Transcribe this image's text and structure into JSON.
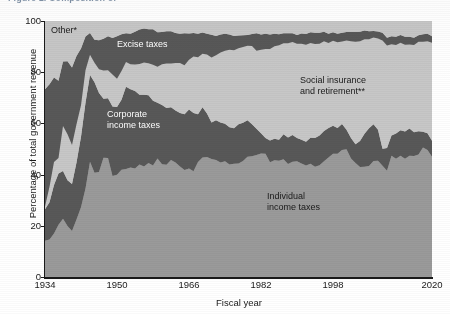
{
  "figure": {
    "title_visible_fragment": "Figure 1. Composition of"
  },
  "axes": {
    "ylabel": "Percentage of total government revenue",
    "xlabel": "Fiscal year",
    "yticks": [
      "0",
      "20",
      "40",
      "60",
      "80",
      "100"
    ],
    "xticks": [
      "1934",
      "1950",
      "1966",
      "1982",
      "1998",
      "2020"
    ]
  },
  "labels": {
    "other": "Other*",
    "excise": "Excise taxes",
    "corporate": "Corporate\nincome taxes",
    "corporate_line1": "Corporate",
    "corporate_line2": "income taxes",
    "social_line1": "Social insurance",
    "social_line2": "and retirement**",
    "individual_line1": "Individual",
    "individual_line2": "income taxes"
  },
  "colors": {
    "individual": "#9a9a9a",
    "corporate": "#585858",
    "social": "#c7c7c7",
    "excise": "#585858",
    "other": "#c7c7c7",
    "plot_background": "#c7c7c7",
    "axis": "#1a1a1a",
    "label_light": "#ffffff",
    "label_dark": "#1a1a1a",
    "title": "#15365c"
  },
  "chart_data": {
    "type": "area",
    "stacked": true,
    "xlabel": "Fiscal year",
    "ylabel": "Percentage of total government revenue",
    "ylim": [
      0,
      100
    ],
    "xlim": [
      1934,
      2020
    ],
    "grid": false,
    "legend": "in-plot annotations",
    "tick_years": [
      1934,
      1950,
      1966,
      1982,
      1998,
      2020
    ],
    "ytick_values": [
      0,
      20,
      40,
      60,
      80,
      100
    ],
    "x": [
      1934,
      1935,
      1936,
      1937,
      1938,
      1939,
      1940,
      1941,
      1942,
      1943,
      1944,
      1945,
      1946,
      1947,
      1948,
      1949,
      1950,
      1951,
      1952,
      1953,
      1954,
      1955,
      1956,
      1957,
      1958,
      1959,
      1960,
      1961,
      1962,
      1963,
      1964,
      1965,
      1966,
      1967,
      1968,
      1969,
      1970,
      1971,
      1972,
      1973,
      1974,
      1975,
      1976,
      1977,
      1978,
      1979,
      1980,
      1981,
      1982,
      1983,
      1984,
      1985,
      1986,
      1987,
      1988,
      1989,
      1990,
      1991,
      1992,
      1993,
      1994,
      1995,
      1996,
      1997,
      1998,
      1999,
      2000,
      2001,
      2002,
      2003,
      2004,
      2005,
      2006,
      2007,
      2008,
      2009,
      2010,
      2011,
      2012,
      2013,
      2014,
      2015,
      2016,
      2017,
      2018,
      2019,
      2020
    ],
    "series": [
      {
        "name": "Individual income taxes",
        "color": "#9a9a9a",
        "values": [
          14.2,
          14.6,
          17.0,
          20.4,
          22.8,
          19.9,
          18.0,
          22.5,
          27.2,
          34.6,
          45.0,
          40.7,
          41.0,
          46.6,
          46.5,
          39.5,
          39.9,
          41.9,
          42.2,
          42.8,
          42.4,
          43.9,
          43.2,
          44.5,
          43.6,
          46.3,
          44.0,
          43.8,
          45.7,
          44.7,
          43.2,
          41.8,
          42.4,
          41.3,
          44.9,
          46.7,
          46.9,
          46.1,
          45.7,
          44.7,
          45.2,
          43.9,
          44.2,
          44.3,
          45.3,
          47.0,
          47.2,
          47.7,
          48.2,
          48.1,
          44.8,
          45.6,
          45.4,
          46.0,
          44.1,
          45.0,
          45.2,
          44.3,
          43.6,
          44.2,
          43.1,
          43.7,
          45.2,
          46.7,
          48.1,
          48.1,
          49.6,
          49.9,
          46.3,
          44.5,
          43.0,
          43.1,
          43.4,
          45.3,
          45.4,
          43.5,
          41.5,
          47.4,
          46.2,
          47.4,
          46.2,
          47.4,
          47.3,
          47.9,
          50.6,
          49.6,
          47.0
        ]
      },
      {
        "name": "Corporate income taxes",
        "color": "#585858",
        "values": [
          12.3,
          14.6,
          18.9,
          20.0,
          18.6,
          17.9,
          18.3,
          22.2,
          27.6,
          33.5,
          33.9,
          35.4,
          30.9,
          23.0,
          23.3,
          27.1,
          26.5,
          27.3,
          32.1,
          30.5,
          30.3,
          27.3,
          28.0,
          26.5,
          25.2,
          21.8,
          23.2,
          22.2,
          20.6,
          20.3,
          20.9,
          21.8,
          23.0,
          22.8,
          18.7,
          19.6,
          17.0,
          14.3,
          15.5,
          15.7,
          14.7,
          14.6,
          13.9,
          15.4,
          15.0,
          14.2,
          12.5,
          10.2,
          8.0,
          6.2,
          8.5,
          8.4,
          8.2,
          9.8,
          10.4,
          10.5,
          9.1,
          9.3,
          9.2,
          10.2,
          11.2,
          11.6,
          11.8,
          11.5,
          11.0,
          10.1,
          10.2,
          7.6,
          8.0,
          7.4,
          10.1,
          12.9,
          14.7,
          14.4,
          12.1,
          6.6,
          8.9,
          7.9,
          9.9,
          9.9,
          10.6,
          10.6,
          9.2,
          9.0,
          6.1,
          6.6,
          6.2
        ]
      },
      {
        "name": "Social insurance and retirement**",
        "color": "#c7c7c7",
        "values": [
          1.0,
          6.1,
          9.0,
          6.1,
          17.6,
          18.0,
          15.3,
          15.0,
          12.3,
          12.7,
          7.9,
          7.6,
          9.3,
          11.1,
          11.0,
          12.5,
          11.0,
          11.3,
          9.7,
          9.8,
          10.3,
          12.0,
          12.6,
          12.5,
          14.1,
          14.0,
          15.9,
          17.4,
          17.1,
          18.6,
          19.5,
          19.1,
          19.5,
          22.0,
          22.2,
          20.9,
          23.0,
          25.3,
          25.4,
          27.3,
          28.5,
          30.3,
          30.5,
          29.7,
          29.5,
          29.1,
          30.5,
          30.5,
          32.6,
          34.8,
          35.8,
          36.1,
          36.9,
          35.5,
          36.8,
          36.3,
          36.8,
          37.5,
          37.9,
          37.0,
          36.7,
          35.8,
          35.1,
          33.2,
          33.2,
          33.5,
          32.2,
          34.9,
          37.8,
          40.0,
          39.0,
          36.9,
          34.8,
          33.9,
          35.7,
          42.3,
          40.0,
          35.6,
          34.5,
          34.2,
          33.9,
          32.8,
          34.1,
          35.0,
          35.2,
          35.9,
          38.3
        ]
      },
      {
        "name": "Excise taxes",
        "color": "#585858",
        "values": [
          45.8,
          40.0,
          33.0,
          30.2,
          25.2,
          28.5,
          30.2,
          26.6,
          22.2,
          13.1,
          8.5,
          9.0,
          11.3,
          12.4,
          13.2,
          14.3,
          16.6,
          14.3,
          11.2,
          11.9,
          12.8,
          13.5,
          13.3,
          13.3,
          13.9,
          13.5,
          12.6,
          12.6,
          12.6,
          11.7,
          11.4,
          12.5,
          10.2,
          9.2,
          9.2,
          8.3,
          8.1,
          8.9,
          7.5,
          7.0,
          6.6,
          5.9,
          5.5,
          4.9,
          4.6,
          4.2,
          4.7,
          6.8,
          5.9,
          5.9,
          5.6,
          4.9,
          4.3,
          3.9,
          3.9,
          3.4,
          3.4,
          4.0,
          4.2,
          4.2,
          4.4,
          4.3,
          3.7,
          3.6,
          3.3,
          3.3,
          3.4,
          3.3,
          3.6,
          3.8,
          3.7,
          3.4,
          3.1,
          2.5,
          2.7,
          3.0,
          3.1,
          3.1,
          3.2,
          3.0,
          3.1,
          3.0,
          2.9,
          2.5,
          2.9,
          2.9,
          2.5
        ]
      },
      {
        "name": "Other*",
        "color": "#c7c7c7",
        "values": [
          26.7,
          24.7,
          22.1,
          23.3,
          15.8,
          15.7,
          18.2,
          13.7,
          10.7,
          6.1,
          4.7,
          7.3,
          7.5,
          6.9,
          6.0,
          6.6,
          6.0,
          5.2,
          4.8,
          5.0,
          4.2,
          3.3,
          2.9,
          3.2,
          3.2,
          4.4,
          4.3,
          4.0,
          4.0,
          4.7,
          5.0,
          4.8,
          4.9,
          4.7,
          5.0,
          4.5,
          5.0,
          5.4,
          5.9,
          5.3,
          5.0,
          5.3,
          5.9,
          5.7,
          5.6,
          5.5,
          5.1,
          4.8,
          5.3,
          5.0,
          5.3,
          5.0,
          5.2,
          4.8,
          4.8,
          4.8,
          5.5,
          4.9,
          5.1,
          4.4,
          4.6,
          4.6,
          4.2,
          5.0,
          4.4,
          5.0,
          4.6,
          4.3,
          4.3,
          4.3,
          4.2,
          3.7,
          4.0,
          3.9,
          4.1,
          4.6,
          6.5,
          6.0,
          6.2,
          5.5,
          6.2,
          6.2,
          6.5,
          5.6,
          5.2,
          5.0,
          6.0
        ]
      }
    ]
  }
}
